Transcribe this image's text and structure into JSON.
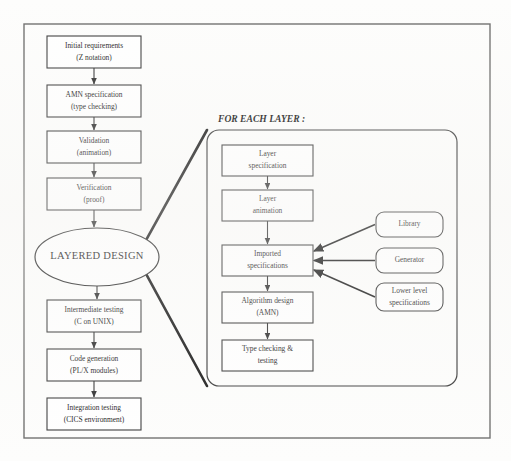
{
  "diagram": {
    "panel_title": "FOR EACH LAYER :",
    "colors": {
      "stroke": "#3a3a3a",
      "text": "#1b1b1b",
      "background": "#fdfdfc",
      "frame": "#6e6e6e"
    },
    "main_flow": [
      {
        "id": "initial-requirements",
        "line1": "Initial requirements",
        "line2": "(Z notation)",
        "x": 47,
        "y": 36,
        "w": 94,
        "h": 32
      },
      {
        "id": "amn-specification",
        "line1": "AMN specification",
        "line2": "(type checking)",
        "x": 47,
        "y": 85,
        "w": 94,
        "h": 32
      },
      {
        "id": "validation",
        "line1": "Validation",
        "line2": "(animation)",
        "x": 47,
        "y": 131,
        "w": 94,
        "h": 32
      },
      {
        "id": "verification",
        "line1": "Verification",
        "line2": "(proof)",
        "x": 47,
        "y": 178,
        "w": 94,
        "h": 32
      },
      {
        "id": "intermediate-testing",
        "line1": "Intermediate testing",
        "line2": "(C on UNIX)",
        "x": 47,
        "y": 300,
        "w": 94,
        "h": 32
      },
      {
        "id": "code-generation",
        "line1": "Code generation",
        "line2": "(PL/X modules)",
        "x": 47,
        "y": 349,
        "w": 94,
        "h": 32
      },
      {
        "id": "integration-testing",
        "line1": "Integration testing",
        "line2": "(CICS environment)",
        "x": 47,
        "y": 398,
        "w": 94,
        "h": 32
      }
    ],
    "hub": {
      "id": "layered-design",
      "label": "LAYERED DESIGN",
      "cx": 97,
      "cy": 257,
      "rx": 62,
      "ry": 29
    },
    "layer_flow": [
      {
        "id": "layer-specification",
        "line1": "Layer",
        "line2": "specification",
        "x": 222,
        "y": 145,
        "w": 91,
        "h": 31
      },
      {
        "id": "layer-animation",
        "line1": "Layer",
        "line2": "animation",
        "x": 222,
        "y": 190,
        "w": 91,
        "h": 31
      },
      {
        "id": "imported-specifications",
        "line1": "Imported",
        "line2": "specifications",
        "x": 222,
        "y": 245,
        "w": 91,
        "h": 31
      },
      {
        "id": "algorithm-design",
        "line1": "Algorithm design",
        "line2": "(AMN)",
        "x": 222,
        "y": 292,
        "w": 91,
        "h": 31
      },
      {
        "id": "type-checking-testing",
        "line1": "Type checking &",
        "line2": "testing",
        "x": 222,
        "y": 340,
        "w": 91,
        "h": 31
      }
    ],
    "sources": [
      {
        "id": "library",
        "line1": "Library",
        "line2": "",
        "x": 376,
        "y": 212,
        "w": 67,
        "h": 25
      },
      {
        "id": "generator",
        "line1": "Generator",
        "line2": "",
        "x": 376,
        "y": 248,
        "w": 67,
        "h": 25
      },
      {
        "id": "lower-level-specifications",
        "line1": "Lower level",
        "line2": "specifications",
        "x": 376,
        "y": 283,
        "w": 67,
        "h": 28
      }
    ],
    "panel": {
      "x": 207,
      "y": 130,
      "w": 250,
      "h": 256,
      "r": 12
    },
    "frame": {
      "x": 24,
      "y": 24,
      "w": 466,
      "h": 414
    }
  }
}
